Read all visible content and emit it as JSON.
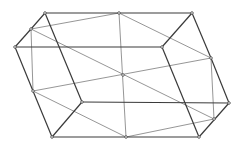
{
  "diagram": {
    "type": "wireframe-polyhedron",
    "colors": {
      "dark_edge": "#3a3a3a",
      "light_edge": "#8a8a8a",
      "vertex": "#444444"
    },
    "vertices": {
      "A": [
        45,
        13
      ],
      "B": [
        119,
        13
      ],
      "C": [
        192,
        13
      ],
      "D": [
        31,
        29
      ],
      "E": [
        15,
        47
      ],
      "F": [
        162,
        47
      ],
      "G": [
        211,
        58
      ],
      "O": [
        123,
        75
      ],
      "H": [
        33,
        91
      ],
      "I": [
        82,
        102
      ],
      "J": [
        229,
        103
      ],
      "K": [
        214,
        119
      ],
      "L": [
        52,
        137
      ],
      "M": [
        126,
        137
      ],
      "N": [
        199,
        137
      ]
    },
    "dark_edges": [
      [
        "A",
        "B"
      ],
      [
        "B",
        "C"
      ],
      [
        "C",
        "G"
      ],
      [
        "G",
        "J"
      ],
      [
        "J",
        "N"
      ],
      [
        "N",
        "M"
      ],
      [
        "M",
        "L"
      ],
      [
        "L",
        "H"
      ],
      [
        "H",
        "E"
      ],
      [
        "E",
        "D"
      ],
      [
        "D",
        "A"
      ],
      [
        "E",
        "F"
      ],
      [
        "F",
        "C"
      ],
      [
        "A",
        "I"
      ],
      [
        "I",
        "J"
      ],
      [
        "I",
        "L"
      ],
      [
        "F",
        "N"
      ]
    ],
    "light_edges": [
      [
        "D",
        "B"
      ],
      [
        "B",
        "G"
      ],
      [
        "G",
        "H"
      ],
      [
        "D",
        "K"
      ],
      [
        "D",
        "H"
      ],
      [
        "H",
        "M"
      ],
      [
        "M",
        "K"
      ],
      [
        "K",
        "G"
      ],
      [
        "B",
        "M"
      ]
    ]
  }
}
